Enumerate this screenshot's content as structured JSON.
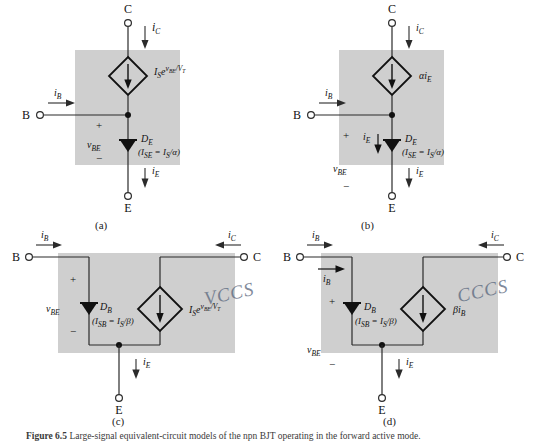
{
  "figure": {
    "caption_label": "Figure 6.5",
    "caption_text": "Large-signal equivalent-circuit models of the npn BJT operating in the forward active mode.",
    "shade_color": "#cfcfcf",
    "wire_color": "#2b2b2b",
    "annotation_color": "#5d6a80"
  },
  "panels": [
    {
      "id": "a",
      "label": "(a)",
      "terminals": {
        "collector": "C",
        "base": "B",
        "emitter": "E"
      },
      "currents": {
        "ic": "i",
        "ic_sub": "C",
        "ib": "i",
        "ib_sub": "B",
        "ie": "i",
        "ie_sub": "E"
      },
      "source_label": "I_S e^{v_BE/V_T}",
      "source_main": "I",
      "source_main_sub": "S",
      "source_exp_base": "e",
      "source_exp_num": "v",
      "source_exp_num_sub": "BE",
      "source_exp_den": "V",
      "source_exp_den_sub": "T",
      "diode_name": "D",
      "diode_name_sub": "E",
      "diode_expr": "(I",
      "diode_expr_sub": "SE",
      "diode_expr_2": " = I",
      "diode_expr_2_sub": "S",
      "diode_expr_3": "/α)",
      "voltage": "v",
      "voltage_sub": "BE",
      "plus": "+",
      "minus": "−",
      "annotation": ""
    },
    {
      "id": "b",
      "label": "(b)",
      "terminals": {
        "collector": "C",
        "base": "B",
        "emitter": "E"
      },
      "currents": {
        "ic": "i",
        "ic_sub": "C",
        "ib": "i",
        "ib_sub": "B",
        "ie": "i",
        "ie_sub": "E"
      },
      "source_label": "αi_E",
      "source_alpha": "αi",
      "source_alpha_sub": "E",
      "diode_name": "D",
      "diode_name_sub": "E",
      "diode_expr": "(I",
      "diode_expr_sub": "SE",
      "diode_expr_2": " = I",
      "diode_expr_2_sub": "S",
      "diode_expr_3": "/α)",
      "voltage": "v",
      "voltage_sub": "BE",
      "plus": "+",
      "minus": "−",
      "inner_ie": "i",
      "inner_ie_sub": "E",
      "annotation": ""
    },
    {
      "id": "c",
      "label": "(c)",
      "terminals": {
        "collector": "C",
        "base": "B",
        "emitter": "E"
      },
      "currents": {
        "ic": "i",
        "ic_sub": "C",
        "ib": "i",
        "ib_sub": "B",
        "ie": "i",
        "ie_sub": "E"
      },
      "source_main": "I",
      "source_main_sub": "S",
      "source_exp_base": "e",
      "source_exp_num": "v",
      "source_exp_num_sub": "BE",
      "source_exp_den": "V",
      "source_exp_den_sub": "T",
      "diode_name": "D",
      "diode_name_sub": "B",
      "diode_expr": "(I",
      "diode_expr_sub": "SB",
      "diode_expr_2": " = I",
      "diode_expr_2_sub": "S",
      "diode_expr_3": "/β)",
      "voltage": "v",
      "voltage_sub": "BE",
      "plus": "+",
      "minus": "−",
      "annotation": "VCCS"
    },
    {
      "id": "d",
      "label": "(d)",
      "terminals": {
        "collector": "C",
        "base": "B",
        "emitter": "E"
      },
      "currents": {
        "ic": "i",
        "ic_sub": "C",
        "ib": "i",
        "ib_sub": "B",
        "ie": "i",
        "ie_sub": "E"
      },
      "source_beta": "βi",
      "source_beta_sub": "B",
      "diode_name": "D",
      "diode_name_sub": "B",
      "diode_expr": "(I",
      "diode_expr_sub": "SB",
      "diode_expr_2": " = I",
      "diode_expr_2_sub": "S",
      "diode_expr_3": "/β)",
      "voltage": "v",
      "voltage_sub": "BE",
      "plus": "+",
      "minus": "−",
      "inner_ib": "i",
      "inner_ib_sub": "B",
      "annotation": "CCCS"
    }
  ]
}
